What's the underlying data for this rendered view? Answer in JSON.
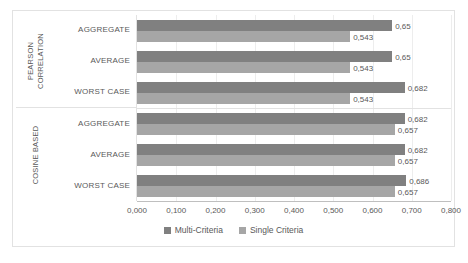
{
  "chart_data": {
    "type": "bar",
    "orientation": "horizontal",
    "title": "",
    "xlabel": "",
    "ylabel": "",
    "xlim": [
      0,
      0.8
    ],
    "grid": true,
    "legend_position": "bottom",
    "x_ticks": [
      "0,000",
      "0,100",
      "0,200",
      "0,300",
      "0,400",
      "0,500",
      "0,600",
      "0,700",
      "0,800"
    ],
    "x_tick_values": [
      0,
      0.1,
      0.2,
      0.3,
      0.4,
      0.5,
      0.6,
      0.7,
      0.8
    ],
    "series": [
      {
        "name": "Multi-Criteria",
        "color": "#808080",
        "values": [
          0.65,
          0.65,
          0.682,
          0.682,
          0.682,
          0.686
        ]
      },
      {
        "name": "Single Criteria",
        "color": "#a6a6a6",
        "values": [
          0.543,
          0.543,
          0.543,
          0.657,
          0.657,
          0.657
        ]
      }
    ],
    "categories": [
      "AGGREGATE",
      "AVERAGE",
      "WORST CASE",
      "AGGREGATE",
      "AVERAGE",
      "WORST CASE"
    ],
    "groups": [
      {
        "label": "PEARSON CORRELATION",
        "label_lines": [
          "PEARSON",
          "CORRELATION"
        ],
        "categories": [
          "AGGREGATE",
          "AVERAGE",
          "WORST CASE"
        ],
        "bars": [
          {
            "category": "AGGREGATE",
            "multi": 0.65,
            "single": 0.543,
            "multi_label": "0,65",
            "single_label": "0,543"
          },
          {
            "category": "AVERAGE",
            "multi": 0.65,
            "single": 0.543,
            "multi_label": "0,65",
            "single_label": "0,543"
          },
          {
            "category": "WORST CASE",
            "multi": 0.682,
            "single": 0.543,
            "multi_label": "0,682",
            "single_label": "0,543"
          }
        ]
      },
      {
        "label": "COSINE BASED",
        "label_lines": [
          "COSINE BASED"
        ],
        "categories": [
          "AGGREGATE",
          "AVERAGE",
          "WORST CASE"
        ],
        "bars": [
          {
            "category": "AGGREGATE",
            "multi": 0.682,
            "single": 0.657,
            "multi_label": "0,682",
            "single_label": "0,657"
          },
          {
            "category": "AVERAGE",
            "multi": 0.682,
            "single": 0.657,
            "multi_label": "0,682",
            "single_label": "0,657"
          },
          {
            "category": "WORST CASE",
            "multi": 0.686,
            "single": 0.657,
            "multi_label": "0,686",
            "single_label": "0,657"
          }
        ]
      }
    ],
    "legend": [
      {
        "label": "Multi-Criteria",
        "color": "#808080"
      },
      {
        "label": "Single Criteria",
        "color": "#a6a6a6"
      }
    ]
  }
}
